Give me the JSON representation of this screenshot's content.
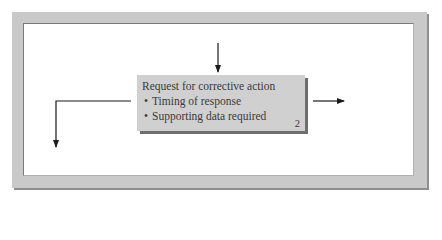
{
  "diagram": {
    "box": {
      "title": "Request for corrective action",
      "bullets": [
        {
          "marker": "•",
          "text": "Timing of response"
        },
        {
          "marker": "•",
          "text": "Supporting data required"
        }
      ],
      "number": "2"
    },
    "arrows": [
      {
        "id": "incoming-top",
        "direction": "down",
        "from": [
          218,
          43
        ],
        "to": [
          218,
          72
        ]
      },
      {
        "id": "outgoing-left-elbow",
        "direction": "left-then-down",
        "points": [
          [
            131,
            101
          ],
          [
            56,
            101
          ],
          [
            56,
            147
          ]
        ]
      },
      {
        "id": "outgoing-right",
        "direction": "right",
        "from": [
          313,
          101
        ],
        "to": [
          344,
          101
        ]
      }
    ],
    "colors": {
      "frame": "#c9c9c9",
      "frame_shadow": "#8e8e8e",
      "panel": "#ffffff",
      "box_fill": "#d0d0d0",
      "box_shadow": "#6e6e6e",
      "text": "#3a3a3a",
      "arrow": "#1a1a1a"
    }
  }
}
